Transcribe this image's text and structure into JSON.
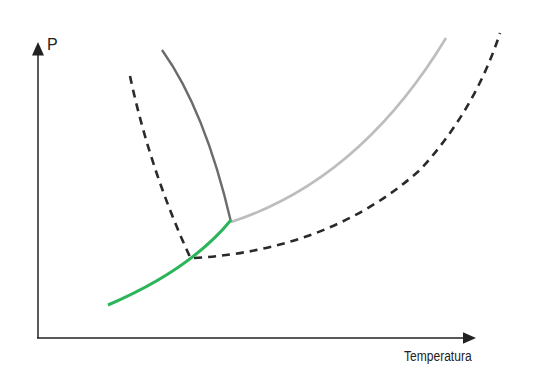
{
  "diagram": {
    "type": "phase-diagram",
    "y_axis_label": "P",
    "x_axis_label": "Temperatura",
    "curves": [
      {
        "name": "sublimation-curve",
        "style": "solid",
        "color": "#2bb55a"
      },
      {
        "name": "fusion-curve",
        "style": "solid",
        "color": "#6b6b6b"
      },
      {
        "name": "vaporization-curve",
        "style": "solid",
        "color": "#bdbdbd"
      },
      {
        "name": "dashed-fusion-curve",
        "style": "dashed",
        "color": "#2a2a2a"
      },
      {
        "name": "dashed-vaporization-curve",
        "style": "dashed",
        "color": "#2a2a2a"
      }
    ],
    "triple_point_marker": "junction of sublimation, fusion and vaporization curves"
  }
}
